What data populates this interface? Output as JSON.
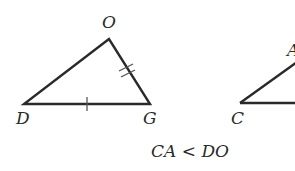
{
  "diagram": {
    "triangle_left": {
      "vertices": {
        "O": {
          "label": "O",
          "x": 109,
          "y": 39
        },
        "D": {
          "label": "D",
          "x": 24,
          "y": 104
        },
        "G": {
          "label": "G",
          "x": 150,
          "y": 104
        }
      },
      "tick_marks": {
        "DG": 1,
        "OG": 2
      }
    },
    "triangle_right": {
      "vertices": {
        "C": {
          "label": "C",
          "x": 240,
          "y": 103
        },
        "A": {
          "label": "A",
          "x": 300,
          "y": 60
        }
      }
    },
    "caption": "CA < DO",
    "stroke_color": "#2a2a2a",
    "background_color": "#ffffff"
  }
}
